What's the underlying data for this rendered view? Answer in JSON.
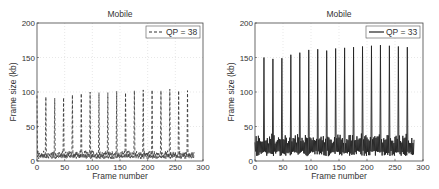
{
  "chart_data": [
    {
      "type": "line",
      "title": "Mobile",
      "xlabel": "Frame number",
      "ylabel": "Frame size (kb)",
      "xlim": [
        0,
        300
      ],
      "ylim": [
        0,
        200
      ],
      "xticks": [
        0,
        50,
        100,
        150,
        200,
        250,
        300
      ],
      "yticks": [
        0,
        50,
        100,
        150,
        200
      ],
      "grid": true,
      "legend_position": "upper right",
      "series": [
        {
          "name": "QP = 38",
          "line_style": "dashed",
          "color": "#333333",
          "gop_length": 16,
          "num_frames": 285,
          "i_frame_indices": [
            0,
            16,
            32,
            48,
            64,
            80,
            96,
            112,
            128,
            144,
            160,
            176,
            192,
            208,
            224,
            240,
            256,
            272
          ],
          "i_frame_sizes": [
            95,
            93,
            91,
            92,
            96,
            98,
            100,
            99,
            99,
            101,
            99,
            102,
            103,
            103,
            102,
            104,
            102,
            102
          ],
          "p_frame_size_range": [
            3,
            15
          ]
        }
      ]
    },
    {
      "type": "line",
      "title": "Mobile",
      "xlabel": "Frame number",
      "ylabel": "Frame size (kb)",
      "xlim": [
        0,
        300
      ],
      "ylim": [
        0,
        200
      ],
      "xticks": [
        0,
        50,
        100,
        150,
        200,
        250,
        300
      ],
      "yticks": [
        0,
        50,
        100,
        150,
        200
      ],
      "grid": true,
      "legend_position": "upper right",
      "series": [
        {
          "name": "QP = 33",
          "line_style": "solid",
          "color": "#222222",
          "gop_length": 16,
          "num_frames": 285,
          "i_frame_indices": [
            16,
            32,
            48,
            64,
            80,
            96,
            112,
            128,
            144,
            160,
            176,
            192,
            208,
            224,
            240,
            256,
            272
          ],
          "i_frame_sizes": [
            150,
            148,
            149,
            154,
            157,
            161,
            162,
            160,
            163,
            164,
            165,
            166,
            167,
            168,
            167,
            166,
            165
          ],
          "p_frame_size_range": [
            7,
            40
          ]
        }
      ]
    }
  ]
}
